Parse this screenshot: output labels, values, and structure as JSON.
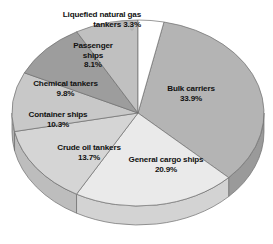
{
  "chart_data": {
    "type": "pie",
    "title": "",
    "subtitle": "",
    "xlabel": "",
    "ylabel": "",
    "legend_position": "none",
    "grid": false,
    "units": "percent",
    "total": 100.0,
    "categories": [
      "Bulk carriers",
      "General cargo ships",
      "Crude oil tankers",
      "Container ships",
      "Chemical tankers",
      "Passenger ships",
      "Liquefied natural gas tankers"
    ],
    "values": [
      33.9,
      20.9,
      13.7,
      10.3,
      9.8,
      8.1,
      3.3
    ],
    "slices": [
      {
        "name": "Bulk carriers",
        "value": 33.9,
        "label": "Bulk carriers\n33.9%",
        "value_text": "33.9%",
        "color": "#b4b4b4",
        "side_color": "#9a9a9a",
        "start_angle": 11.9,
        "end_angle": 134.0,
        "callout": false
      },
      {
        "name": "General cargo ships",
        "value": 20.9,
        "label": "General cargo ships\n20.9%",
        "value_text": "20.9%",
        "color": "#eaeaea",
        "side_color": "#d3d3d3",
        "start_angle": 134.0,
        "end_angle": 209.2,
        "callout": false
      },
      {
        "name": "Crude oil tankers",
        "value": 13.7,
        "label": "Crude oil tankers\n13.7%",
        "value_text": "13.7%",
        "color": "#d5d5d5",
        "side_color": "#bdbdbd",
        "start_angle": 209.2,
        "end_angle": 258.5,
        "callout": false
      },
      {
        "name": "Container ships",
        "value": 10.3,
        "label": "Container ships\n10.3%",
        "value_text": "10.3%",
        "color": "#c8c8c8",
        "side_color": "#b0b0b0",
        "start_angle": 258.5,
        "end_angle": 295.6,
        "callout": false
      },
      {
        "name": "Chemical tankers",
        "value": 9.8,
        "label": "Chemical tankers\n9.8%",
        "value_text": "9.8%",
        "color": "#9d9d9d",
        "side_color": "#8a8a8a",
        "start_angle": 295.6,
        "end_angle": 330.9,
        "callout": false
      },
      {
        "name": "Passenger ships",
        "value": 8.1,
        "label": "Passenger\nships\n8.1%",
        "value_text": "8.1%",
        "color": "#c0c0c0",
        "side_color": "#a8a8a8",
        "start_angle": 330.9,
        "end_angle": 360.0,
        "callout": false
      },
      {
        "name": "Liquefied natural gas tankers",
        "value": 3.3,
        "label": "Liquefied natural gas\ntankers 3.3%",
        "value_text": "3.3%",
        "color": "#ffffff",
        "side_color": "#ededed",
        "start_angle": 0.0,
        "end_angle": 11.9,
        "callout": true
      }
    ]
  },
  "labels": {
    "bulk_carriers": "Bulk carriers\n33.9%",
    "general_cargo_ships": "General cargo ships\n20.9%",
    "crude_oil_tankers": "Crude oil tankers\n13.7%",
    "container_ships": "Container ships\n10.3%",
    "chemical_tankers": "Chemical tankers\n9.8%",
    "passenger_ships": "Passenger\nships\n8.1%",
    "lng_tankers": "Liquefied natural gas\ntankers 3.3%"
  },
  "colors": {
    "background": "#ffffff",
    "text": "#111111",
    "outline": "#6e6e6e",
    "callout_line": "#9a9a9a"
  }
}
